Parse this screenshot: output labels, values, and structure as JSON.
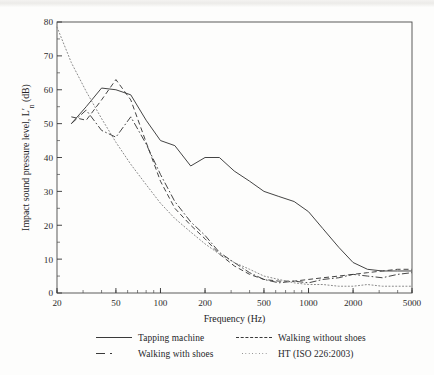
{
  "figure": {
    "background_color": "#fdfdfc",
    "line_color": "#3a3a3a",
    "dotted_color": "#8a8a8a"
  },
  "legend": {
    "items": [
      {
        "label": "Tapping machine",
        "style": "solid"
      },
      {
        "label": "Walking without shoes",
        "style": "dashed"
      },
      {
        "label": "Walking with shoes",
        "style": "dashdot"
      },
      {
        "label": "HT (ISO 226:2003)",
        "style": "dotted"
      }
    ]
  },
  "chart_data": {
    "type": "line",
    "title": "",
    "xlabel": "Frequency (Hz)",
    "ylabel": "Impact sound pressure level, L'n (dB)",
    "xscale": "log",
    "xlim": [
      20,
      5000
    ],
    "ylim": [
      0,
      80
    ],
    "xticks": [
      20,
      50,
      100,
      200,
      500,
      1000,
      2000,
      5000
    ],
    "xtick_labels": [
      "20",
      "50",
      "100",
      "200",
      "500",
      "1000",
      "2000",
      "5000"
    ],
    "yticks": [
      0,
      10,
      20,
      30,
      40,
      50,
      60,
      70,
      80
    ],
    "ytick_labels": [
      "0",
      "10",
      "20",
      "30",
      "40",
      "50",
      "60",
      "70",
      "80"
    ],
    "grid": false,
    "legend_position": "below",
    "series": [
      {
        "name": "Tapping machine",
        "style": "solid",
        "x": [
          25,
          31.5,
          40,
          50,
          63,
          80,
          100,
          125,
          160,
          200,
          250,
          315,
          400,
          500,
          630,
          800,
          1000,
          1250,
          1600,
          2000,
          2500,
          3150,
          4000,
          5000
        ],
        "y": [
          50,
          55,
          60.5,
          60,
          58.5,
          51,
          45,
          43.5,
          37.5,
          40,
          40,
          36,
          33,
          30,
          28.5,
          27,
          24,
          19,
          13.5,
          9,
          7,
          6.5,
          6.5,
          6.5
        ]
      },
      {
        "name": "Walking without shoes",
        "style": "dashed",
        "x": [
          25,
          31.5,
          40,
          50,
          63,
          80,
          100,
          125,
          160,
          200,
          250,
          315,
          400,
          500,
          630,
          800,
          1000,
          1250,
          1600,
          2000,
          2500,
          3150,
          4000,
          5000
        ],
        "y": [
          52,
          51,
          57,
          63,
          57,
          44.5,
          33,
          25,
          20,
          16,
          11.5,
          8,
          5.5,
          4,
          3.5,
          3.5,
          4,
          4.5,
          5,
          5.5,
          6,
          6.5,
          7,
          7
        ]
      },
      {
        "name": "Walking with shoes",
        "style": "dashdot",
        "x": [
          25,
          31.5,
          40,
          50,
          63,
          80,
          100,
          125,
          160,
          200,
          250,
          315,
          400,
          500,
          630,
          800,
          1000,
          1250,
          1600,
          2000,
          2500,
          3150,
          4000,
          5000
        ],
        "y": [
          50,
          54,
          48,
          46,
          52,
          44,
          35,
          27,
          21,
          17,
          12,
          9,
          6,
          4,
          3,
          3.5,
          3,
          4,
          4.5,
          5.5,
          5,
          4.5,
          5.5,
          6
        ]
      },
      {
        "name": "HT (ISO 226:2003)",
        "style": "dotted",
        "x": [
          20,
          25,
          31.5,
          40,
          50,
          63,
          80,
          100,
          125,
          160,
          200,
          250,
          315,
          400,
          500,
          630,
          800,
          1000,
          1250,
          1600,
          2000,
          2500,
          3150,
          4000,
          5000
        ],
        "y": [
          78.5,
          68,
          59.5,
          51.5,
          44.5,
          38,
          32,
          26.5,
          22,
          18,
          14.5,
          11.5,
          9,
          7,
          5,
          4,
          3,
          2.5,
          2.5,
          2,
          2,
          2.5,
          2,
          2,
          2
        ]
      }
    ]
  }
}
